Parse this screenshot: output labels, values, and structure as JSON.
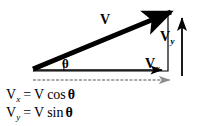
{
  "figure": {
    "background_color": "#ffffff",
    "ink_color": "#000000",
    "guide_color": "#8c8c8c",
    "width": 201,
    "height": 126
  },
  "labels": {
    "resultant": "V",
    "vertical_component_symbol": "V",
    "vertical_component_subscript": "y",
    "horizontal_component_symbol": "V",
    "horizontal_component_subscript": "x",
    "angle": "θ"
  },
  "equations": [
    {
      "lhs_symbol": "V",
      "lhs_subscript": "x",
      "operator": "=",
      "rhs_magnitude": "V",
      "rhs_function": "cos",
      "rhs_angle": "θ"
    },
    {
      "lhs_symbol": "V",
      "lhs_subscript": "y",
      "operator": "=",
      "rhs_magnitude": "V",
      "rhs_function": "sin",
      "rhs_angle": "θ"
    }
  ],
  "geometry": {
    "origin": {
      "x": 33,
      "y": 71
    },
    "tip": {
      "x": 176,
      "y": 9
    },
    "corner": {
      "x": 168,
      "y": 71
    },
    "resultant_stroke_width": 5,
    "outline_stroke_width": 1.2,
    "component_stroke_width": 1.6,
    "vy_arrow_x": 182,
    "vy_arrow_top": 13,
    "vy_arrow_bottom": 76,
    "vx_arrow_y": 70,
    "vx_arrow_from": 34,
    "vx_arrow_to": 167,
    "guide_arrow_y": 80,
    "guide_arrow_from": 33,
    "guide_arrow_to": 176
  }
}
